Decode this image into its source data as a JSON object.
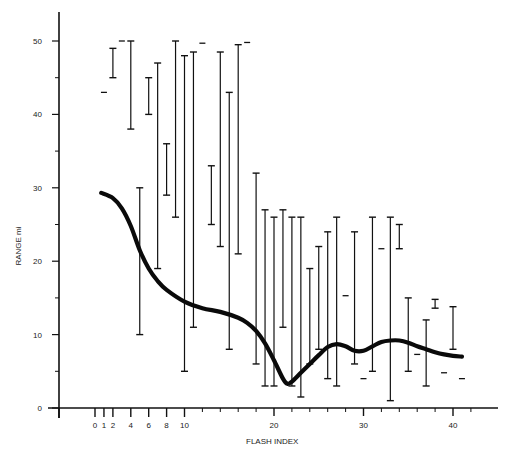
{
  "chart_data": {
    "type": "scatter",
    "title": "",
    "xlabel": "FLASH INDEX",
    "ylabel": "RANGE mi",
    "xlim": [
      -4,
      46
    ],
    "ylim": [
      0,
      55
    ],
    "grid": false,
    "legend": null,
    "x_ticks_labeled": [
      0,
      1,
      2,
      4,
      6,
      8,
      10,
      20,
      30,
      40
    ],
    "y_ticks_labeled": [
      0,
      10,
      20,
      30,
      40,
      50
    ],
    "y_minor_ticks": [
      5,
      15,
      25,
      35,
      45
    ],
    "error_bars": [
      {
        "x": 1,
        "low": 43,
        "high": 43
      },
      {
        "x": 2,
        "low": 45,
        "high": 49
      },
      {
        "x": 3,
        "low": 50,
        "high": 50
      },
      {
        "x": 4,
        "low": 38,
        "high": 50
      },
      {
        "x": 5,
        "low": 10,
        "high": 30
      },
      {
        "x": 6,
        "low": 40,
        "high": 45
      },
      {
        "x": 7,
        "low": 19,
        "high": 47
      },
      {
        "x": 8,
        "low": 29,
        "high": 36
      },
      {
        "x": 9,
        "low": 26,
        "high": 50
      },
      {
        "x": 10,
        "low": 5,
        "high": 48
      },
      {
        "x": 11,
        "low": 11,
        "high": 48.5
      },
      {
        "x": 12,
        "low": 49.7,
        "high": 49.7
      },
      {
        "x": 13,
        "low": 25,
        "high": 33
      },
      {
        "x": 14,
        "low": 22,
        "high": 48.5
      },
      {
        "x": 15,
        "low": 8,
        "high": 43
      },
      {
        "x": 16,
        "low": 21,
        "high": 49.5
      },
      {
        "x": 17,
        "low": 49.8,
        "high": 49.8
      },
      {
        "x": 18,
        "low": 6,
        "high": 32
      },
      {
        "x": 19,
        "low": 3,
        "high": 27
      },
      {
        "x": 20,
        "low": 3,
        "high": 26
      },
      {
        "x": 21,
        "low": 11,
        "high": 27
      },
      {
        "x": 22,
        "low": 3,
        "high": 26
      },
      {
        "x": 23,
        "low": 1.5,
        "high": 26
      },
      {
        "x": 24,
        "low": 6,
        "high": 19
      },
      {
        "x": 25,
        "low": 8,
        "high": 22
      },
      {
        "x": 26,
        "low": 4,
        "high": 24
      },
      {
        "x": 27,
        "low": 3,
        "high": 26
      },
      {
        "x": 28,
        "low": 15.3,
        "high": 15.3
      },
      {
        "x": 29,
        "low": 6,
        "high": 24
      },
      {
        "x": 30,
        "low": 4,
        "high": 4
      },
      {
        "x": 31,
        "low": 5,
        "high": 26
      },
      {
        "x": 32,
        "low": 21.7,
        "high": 21.7
      },
      {
        "x": 33,
        "low": 1,
        "high": 26
      },
      {
        "x": 34,
        "low": 21.7,
        "high": 25
      },
      {
        "x": 35,
        "low": 5,
        "high": 15
      },
      {
        "x": 36,
        "low": 7.3,
        "high": 7.3
      },
      {
        "x": 37,
        "low": 3,
        "high": 12
      },
      {
        "x": 38,
        "low": 13.6,
        "high": 14.8
      },
      {
        "x": 39,
        "low": 4.8,
        "high": 4.8
      },
      {
        "x": 40,
        "low": 8,
        "high": 13.8
      },
      {
        "x": 41,
        "low": 4,
        "high": 4
      }
    ],
    "series": [
      {
        "name": "smoothed mean range",
        "type": "line",
        "x": [
          0.7,
          2,
          3,
          4,
          5,
          6,
          7,
          8,
          10,
          12,
          14,
          16,
          17,
          18,
          19,
          20,
          21,
          21.5,
          22,
          23,
          24,
          25,
          26,
          27,
          28,
          29,
          30,
          31,
          32,
          33,
          34,
          35,
          36,
          37,
          38,
          39,
          40,
          41
        ],
        "values": [
          29.3,
          28.6,
          27.2,
          24.8,
          21.5,
          19,
          17.3,
          16.1,
          14.5,
          13.6,
          13.1,
          12.3,
          11.6,
          10.5,
          8.8,
          6.5,
          4,
          3.3,
          3.6,
          4.8,
          6,
          7.2,
          8.3,
          8.7,
          8.4,
          7.8,
          7.8,
          8.4,
          9,
          9.2,
          9.2,
          8.9,
          8.4,
          8,
          7.6,
          7.3,
          7.1,
          7
        ]
      }
    ]
  },
  "axes": {
    "x_title": "FLASH INDEX",
    "y_title": "RANGE mi"
  }
}
